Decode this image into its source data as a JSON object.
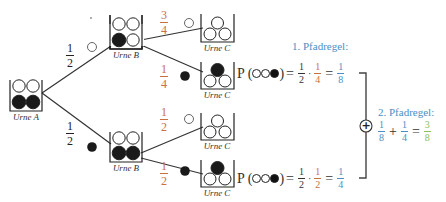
{
  "colors": {
    "orange": "#c8703f",
    "blue": "#4a8fc4",
    "green": "#8ac056",
    "ink": "#222222"
  },
  "urns": {
    "a": {
      "label": "Urne A",
      "balls": [
        "white",
        "white",
        "black",
        "black"
      ]
    },
    "b_top": {
      "label": "Urne B",
      "balls": [
        "white",
        "white",
        "black",
        "white"
      ]
    },
    "b_bottom": {
      "label": "Urne B",
      "balls": [
        "white",
        "white",
        "black",
        "black"
      ]
    },
    "c1": {
      "label": "Urne C",
      "balls": [
        "white",
        "white",
        "white"
      ]
    },
    "c2": {
      "label": "Urne C",
      "balls": [
        "black",
        "white",
        "white"
      ]
    },
    "c3": {
      "label": "Urne C",
      "balls": [
        "white",
        "white",
        "white"
      ]
    },
    "c4": {
      "label": "Urne C",
      "balls": [
        "black",
        "white",
        "white"
      ]
    }
  },
  "branches": {
    "a_to_b_top": {
      "num": "1",
      "den": "2",
      "ball": "white"
    },
    "a_to_b_bottom": {
      "num": "1",
      "den": "2",
      "ball": "black"
    },
    "b_top_to_c1": {
      "num": "3",
      "den": "4",
      "ball": "white"
    },
    "b_top_to_c2": {
      "num": "1",
      "den": "4",
      "ball": "black"
    },
    "b_bottom_to_c3": {
      "num": "1",
      "den": "2",
      "ball": "white"
    },
    "b_bottom_to_c4": {
      "num": "1",
      "den": "2",
      "ball": "black"
    }
  },
  "formulas": {
    "top": {
      "prefix": "P (",
      "suffix": ")",
      "sequence": [
        "white",
        "white",
        "black"
      ],
      "eq": "=",
      "f1": {
        "num": "1",
        "den": "2"
      },
      "mul": "·",
      "f2": {
        "num": "1",
        "den": "4"
      },
      "eq2": "=",
      "result": {
        "num": "1",
        "den": "8"
      }
    },
    "bottom": {
      "prefix": "P (",
      "suffix": ")",
      "sequence": [
        "white",
        "white",
        "black"
      ],
      "eq": "=",
      "f1": {
        "num": "1",
        "den": "2"
      },
      "mul": "·",
      "f2": {
        "num": "1",
        "den": "2"
      },
      "eq2": "=",
      "result": {
        "num": "1",
        "den": "4"
      }
    }
  },
  "rule1": {
    "title": "1. Pfadregel:"
  },
  "rule2": {
    "title": "2. Pfadregel:",
    "a": {
      "num": "1",
      "den": "8"
    },
    "plus": "+",
    "b": {
      "num": "1",
      "den": "4"
    },
    "eq": "=",
    "result": {
      "num": "3",
      "den": "8"
    }
  },
  "sum_symbol": "+"
}
